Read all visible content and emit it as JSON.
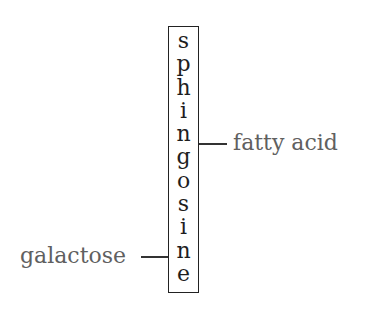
{
  "diagram": {
    "title": "",
    "backbone": {
      "label": "sphingosine",
      "letters": [
        "s",
        "p",
        "h",
        "i",
        "n",
        "g",
        "o",
        "s",
        "i",
        "n",
        "e"
      ]
    },
    "attachments": [
      {
        "label": "fatty acid",
        "side": "right"
      },
      {
        "label": "galactose",
        "side": "left"
      }
    ],
    "colors": {
      "box_border": "#222222",
      "backbone_text": "#1e1e1e",
      "label_text": "#606060",
      "connector": "#333333"
    }
  }
}
